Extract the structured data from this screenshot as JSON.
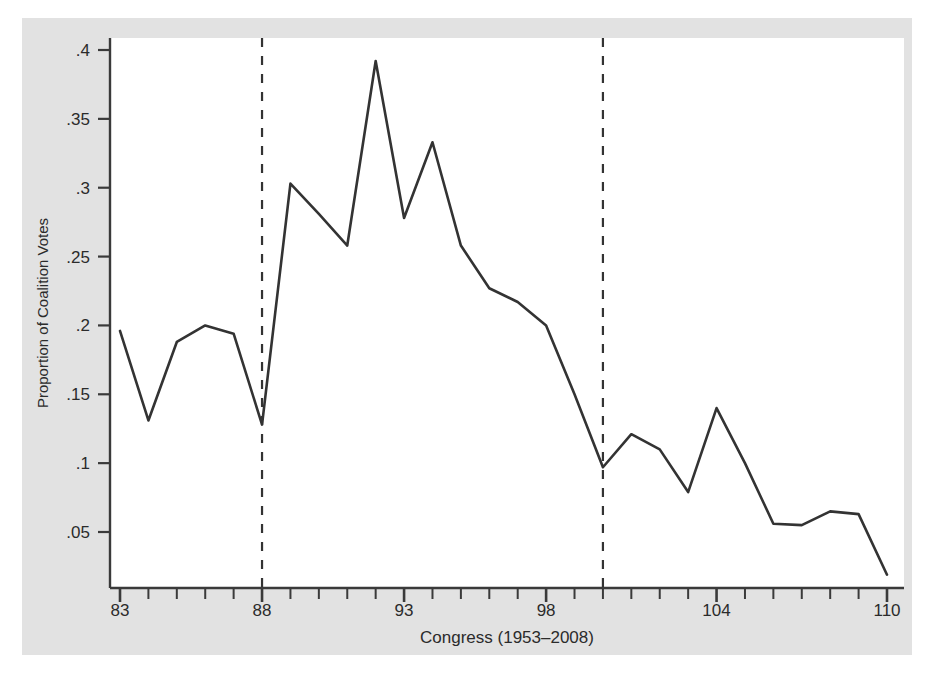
{
  "figure": {
    "background_color": "#e2e2e2",
    "plot_background_color": "#ffffff",
    "line_color": "#333333",
    "axis_color": "#3a3a3a",
    "reference_line_color": "#333333"
  },
  "chart_data": {
    "type": "line",
    "title": "",
    "xlabel": "Congress (1953–2008)",
    "ylabel": "Proportion of Coalition Votes",
    "xlim": [
      83,
      110
    ],
    "ylim": [
      0,
      0.42
    ],
    "grid": false,
    "legend": null,
    "x_tick_labels": [
      "83",
      "88",
      "93",
      "98",
      "104",
      "110"
    ],
    "x_tick_values": [
      83,
      88,
      93,
      98,
      104,
      110
    ],
    "x_minor_ticks": [
      83,
      84,
      85,
      86,
      87,
      88,
      89,
      90,
      91,
      92,
      93,
      94,
      95,
      96,
      97,
      98,
      99,
      100,
      101,
      102,
      103,
      104,
      105,
      106,
      107,
      108,
      109,
      110
    ],
    "y_tick_labels": [
      ".05",
      ".1",
      ".15",
      ".2",
      ".25",
      ".3",
      ".35",
      ".4"
    ],
    "y_tick_values": [
      0.05,
      0.1,
      0.15,
      0.2,
      0.25,
      0.3,
      0.35,
      0.4
    ],
    "annotations": [
      {
        "type": "vertical-dashed-line",
        "x": 88,
        "name": "reference-line-88"
      },
      {
        "type": "vertical-dashed-line",
        "x": 100,
        "name": "reference-line-100"
      }
    ],
    "x": [
      83,
      84,
      85,
      86,
      87,
      88,
      89,
      90,
      91,
      92,
      93,
      94,
      95,
      96,
      97,
      98,
      99,
      100,
      101,
      102,
      103,
      104,
      105,
      106,
      107,
      108,
      109,
      110
    ],
    "values": [
      0.196,
      0.131,
      0.188,
      0.2,
      0.194,
      0.128,
      0.303,
      0.281,
      0.258,
      0.392,
      0.278,
      0.333,
      0.258,
      0.227,
      0.217,
      0.2,
      0.15,
      0.097,
      0.121,
      0.11,
      0.079,
      0.14,
      0.1,
      0.056,
      0.055,
      0.065,
      0.063,
      0.019
    ],
    "series": [
      {
        "name": "Proportion of Coalition Votes",
        "values": [
          0.196,
          0.131,
          0.188,
          0.2,
          0.194,
          0.128,
          0.303,
          0.281,
          0.258,
          0.392,
          0.278,
          0.333,
          0.258,
          0.227,
          0.217,
          0.2,
          0.15,
          0.097,
          0.121,
          0.11,
          0.079,
          0.14,
          0.1,
          0.056,
          0.055,
          0.065,
          0.063,
          0.019
        ]
      }
    ]
  }
}
